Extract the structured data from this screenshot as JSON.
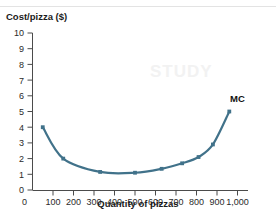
{
  "figure": {
    "watermark_text": "STUDY"
  },
  "chart_data": {
    "type": "line",
    "title": "",
    "subtitle": "",
    "xlabel": "Quantity of pizzas",
    "ylabel": "Cost/pizza ($)",
    "xlim": [
      0,
      1000
    ],
    "ylim": [
      0,
      10
    ],
    "grid": false,
    "legend_position": "inline-right-end",
    "x_ticks": [
      0,
      100,
      200,
      300,
      400,
      500,
      600,
      700,
      800,
      900,
      1000
    ],
    "x_tick_labels": [
      "0",
      "100",
      "200",
      "300",
      "400",
      "500",
      "600",
      "700",
      "800",
      "900",
      "1,000"
    ],
    "y_ticks": [
      0,
      1,
      2,
      3,
      4,
      5,
      6,
      7,
      8,
      9,
      10
    ],
    "y_tick_labels": [
      "0",
      "1",
      "2",
      "3",
      "4",
      "5",
      "6",
      "7",
      "8",
      "9",
      "10"
    ],
    "series": [
      {
        "name": "MC",
        "label_text": "MC",
        "color": "#41728a",
        "marker": "square",
        "x": [
          50,
          150,
          330,
          500,
          630,
          730,
          810,
          880,
          960
        ],
        "y": [
          4.0,
          2.0,
          1.15,
          1.1,
          1.35,
          1.7,
          2.1,
          2.9,
          5.0
        ]
      }
    ],
    "annotations": [
      {
        "text": "MC",
        "x": 1000,
        "y": 5.6
      }
    ]
  }
}
